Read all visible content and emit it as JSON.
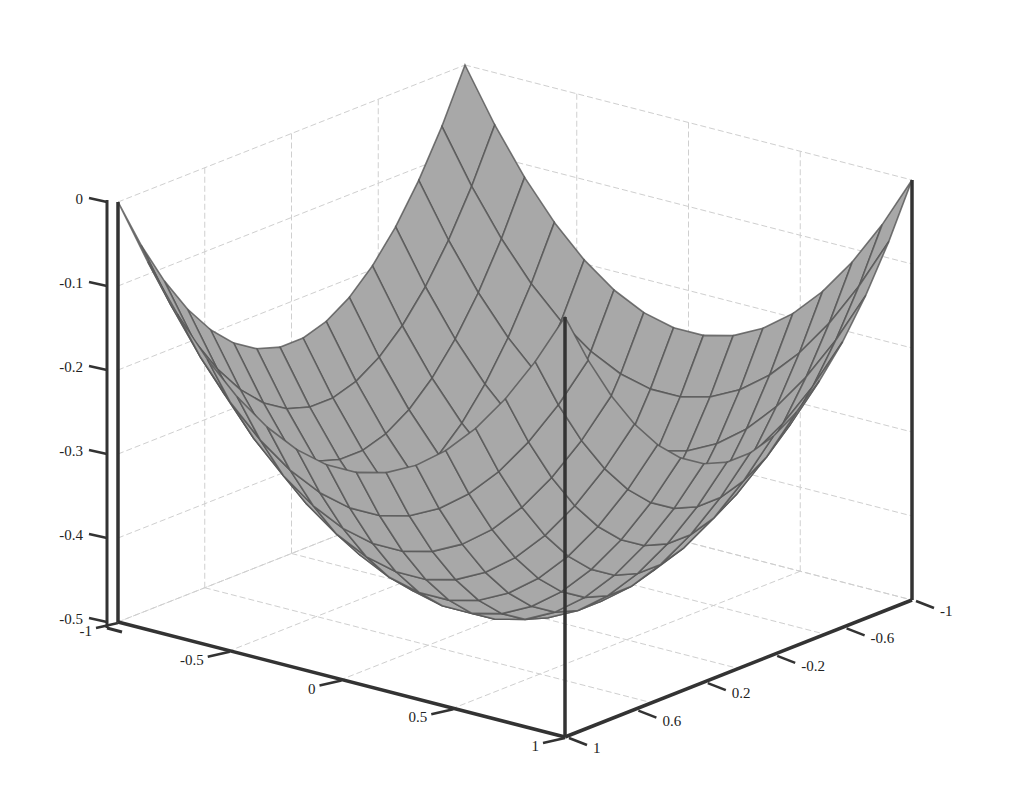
{
  "chart_data": {
    "type": "surface3d",
    "title": "",
    "function": "z = (x^2 + y^2)/4 - 0.5",
    "xlabel": "",
    "ylabel": "",
    "zlabel": "",
    "x_range": [
      -1,
      1
    ],
    "y_range": [
      -1,
      1
    ],
    "z_range": [
      -0.5,
      0
    ],
    "grid": true,
    "mesh_lines": 15,
    "x_ticks": [
      -1,
      -0.5,
      0,
      0.5,
      1
    ],
    "x_tick_labels": [
      "-1",
      "-0.5",
      "0",
      "0.5",
      "1"
    ],
    "y_ticks": [
      -1,
      -0.6,
      -0.2,
      0.2,
      0.6,
      1
    ],
    "y_tick_labels": [
      "-1",
      "-0.6",
      "-0.2",
      "0.2",
      "0.6",
      "1"
    ],
    "z_ticks": [
      0,
      -0.1,
      -0.2,
      -0.3,
      -0.4,
      -0.5
    ],
    "z_tick_labels": [
      "0",
      "-0.1",
      "-0.2",
      "-0.3",
      "-0.4",
      "-0.5"
    ],
    "corner_values": [
      {
        "x": -1,
        "y": -1,
        "z": 0
      },
      {
        "x": -1,
        "y": 1,
        "z": 0
      },
      {
        "x": 1,
        "y": 1,
        "z": 0
      },
      {
        "x": 1,
        "y": -1,
        "z": 0
      }
    ],
    "minimum": {
      "x": 0,
      "y": 0,
      "z": -0.5
    },
    "colors": {
      "surface": "#a8a8a8",
      "mesh": "#555555",
      "axis": "#333333",
      "grid": "#cfcfcf"
    }
  }
}
